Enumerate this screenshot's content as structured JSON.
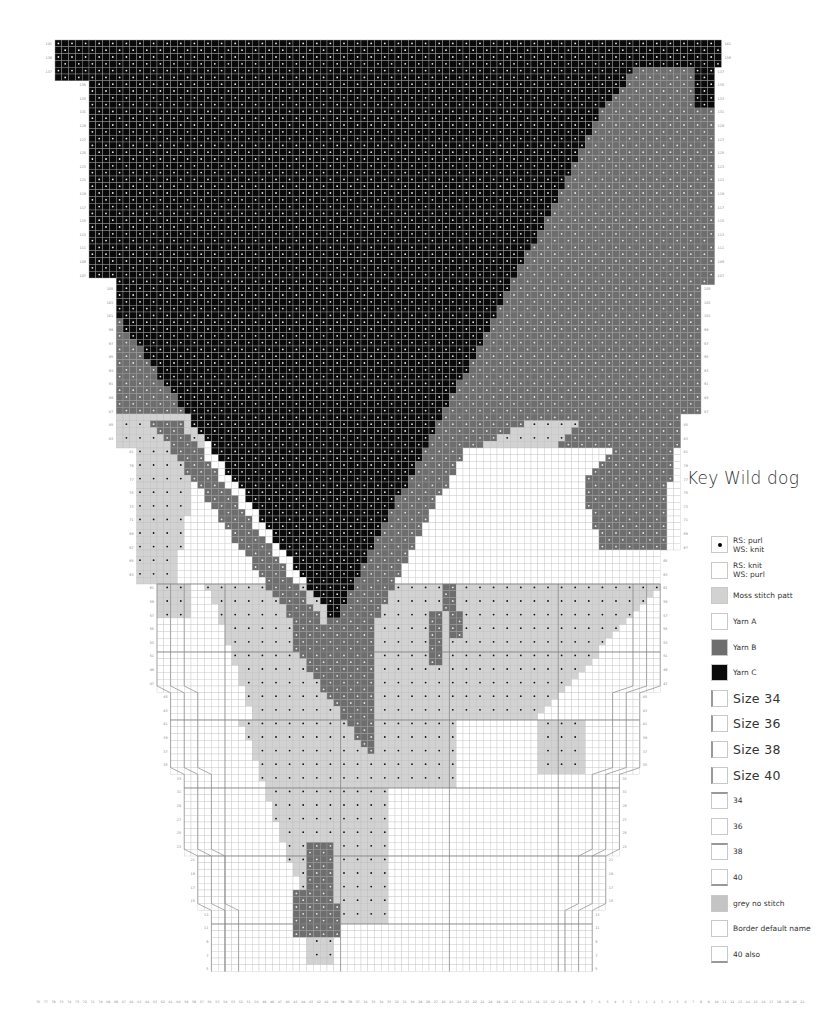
{
  "title": "Key Wild dog",
  "legend": [
    {
      "label": "RS: purl\nWS: knit",
      "fill": "#ffffff",
      "dot": true,
      "size": "small",
      "edge": ""
    },
    {
      "label": "RS: knit\nWS: purl",
      "fill": "#ffffff",
      "dot": false,
      "size": "small",
      "edge": ""
    },
    {
      "label": "Moss stitch patt",
      "fill": "#d2d2d2",
      "dot": false,
      "size": "small",
      "edge": ""
    },
    {
      "label": "Yarn A",
      "fill": "#ffffff",
      "dot": false,
      "size": "small",
      "edge": ""
    },
    {
      "label": "Yarn B",
      "fill": "#6e6e6e",
      "dot": false,
      "size": "small",
      "edge": ""
    },
    {
      "label": "Yarn C",
      "fill": "#0a0a0a",
      "dot": false,
      "size": "small",
      "edge": ""
    },
    {
      "label": "Size 34",
      "fill": "#ffffff",
      "dot": false,
      "size": "big",
      "edge": "left"
    },
    {
      "label": "Size 36",
      "fill": "#ffffff",
      "dot": false,
      "size": "big",
      "edge": "left"
    },
    {
      "label": "Size 38",
      "fill": "#ffffff",
      "dot": false,
      "size": "big",
      "edge": "left"
    },
    {
      "label": "Size 40",
      "fill": "#ffffff",
      "dot": false,
      "size": "big",
      "edge": "left"
    },
    {
      "label": "34",
      "fill": "#ffffff",
      "dot": false,
      "size": "small",
      "edge": "top"
    },
    {
      "label": "36",
      "fill": "#ffffff",
      "dot": false,
      "size": "small",
      "edge": ""
    },
    {
      "label": "38",
      "fill": "#ffffff",
      "dot": false,
      "size": "small",
      "edge": "top"
    },
    {
      "label": "40",
      "fill": "#ffffff",
      "dot": false,
      "size": "small",
      "edge": "bottom"
    },
    {
      "label": "grey no stitch",
      "fill": "#c4c4c4",
      "dot": false,
      "size": "small",
      "edge": ""
    },
    {
      "label": "Border default name",
      "fill": "#ffffff",
      "dot": false,
      "size": "small",
      "edge": ""
    },
    {
      "label": "40 also",
      "fill": "#ffffff",
      "dot": false,
      "size": "small",
      "edge": "bottom"
    }
  ],
  "colors": {
    "yarn_a": "#ffffff",
    "yarn_b": "#6e6e6e",
    "yarn_c": "#0a0a0a",
    "moss": "#d2d2d2",
    "grid": "#c9c9c9",
    "grid_major": "#777777"
  },
  "chart": {
    "origin_x": 55,
    "origin_y": 40,
    "cell": 6.8,
    "cols": 98,
    "rows": 137,
    "row_label_start": 141,
    "col_labels_left": [
      76,
      77,
      78,
      75,
      74,
      73,
      72,
      71,
      70,
      69,
      68,
      67,
      66,
      65,
      64,
      63,
      62,
      61,
      60,
      59,
      58,
      57,
      56,
      55,
      54,
      53,
      52,
      51,
      50,
      49,
      48,
      47,
      46,
      45,
      44,
      43,
      42,
      41,
      40,
      39,
      38,
      37,
      36,
      35,
      34,
      33,
      32,
      31,
      30,
      29,
      28,
      27,
      26,
      25,
      24,
      23,
      22,
      21,
      20,
      19,
      18,
      17,
      16,
      15,
      14,
      13,
      12,
      11,
      10,
      9,
      8,
      7,
      6,
      5,
      4,
      3,
      2,
      1
    ],
    "col_labels_right": [
      1,
      2,
      3,
      4,
      5,
      6,
      7,
      8,
      9,
      10,
      11,
      12,
      13,
      14,
      15,
      16,
      17,
      18,
      19,
      20,
      21
    ]
  }
}
